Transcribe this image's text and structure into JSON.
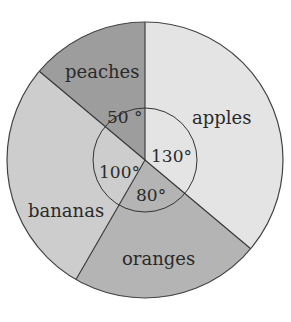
{
  "chart_data": {
    "type": "pie",
    "title": "",
    "unit": "degrees",
    "categories": [
      "apples",
      "oranges",
      "bananas",
      "peaches"
    ],
    "values": [
      130,
      80,
      100,
      50
    ],
    "labels": [
      "130°",
      "80°",
      "100°",
      "50 °"
    ],
    "start_angle": 0,
    "direction": "clockwise",
    "colors": {
      "apples": "#e4e4e4",
      "oranges": "#b4b4b4",
      "bananas": "#cdcdcd",
      "peaches": "#9d9d9d"
    },
    "legend": "none (labels inside slices)",
    "inner_angle_circle": true
  }
}
